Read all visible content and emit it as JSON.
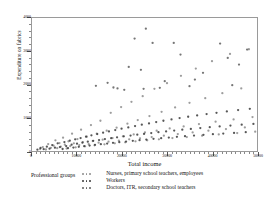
{
  "chart_data": {
    "type": "scatter",
    "title": "",
    "xlabel": "Total income",
    "ylabel": "Expenditure on fabrics",
    "xlim": [
      0,
      50000
    ],
    "ylim": [
      0,
      4000
    ],
    "xticks": [
      0,
      10000,
      20000,
      30000,
      40000,
      50000
    ],
    "xtick_labels": [
      "0",
      "10000",
      "20000",
      "30000",
      "40000",
      "50000"
    ],
    "yticks": [
      0,
      1000,
      2000,
      3000,
      4000
    ],
    "ytick_labels": [
      "0",
      "1000",
      "2000",
      "3000",
      "4000"
    ],
    "grid": false,
    "legend_position": "below-left",
    "legend_title": "Professional groups",
    "series": [
      {
        "name": "Nurses, primary school teachers, employees",
        "color": "#8c8c8c",
        "marker": "circle",
        "points": [
          [
            1800,
            60
          ],
          [
            2400,
            120
          ],
          [
            3100,
            45
          ],
          [
            3600,
            210
          ],
          [
            4200,
            95
          ],
          [
            4800,
            160
          ],
          [
            5200,
            320
          ],
          [
            5600,
            85
          ],
          [
            6100,
            240
          ],
          [
            6400,
            130
          ],
          [
            6900,
            400
          ],
          [
            7300,
            190
          ],
          [
            7700,
            75
          ],
          [
            8100,
            290
          ],
          [
            8500,
            150
          ],
          [
            8900,
            520
          ],
          [
            9300,
            230
          ],
          [
            9700,
            110
          ],
          [
            10100,
            360
          ],
          [
            10500,
            180
          ],
          [
            10900,
            640
          ],
          [
            11300,
            270
          ],
          [
            11800,
            140
          ],
          [
            12200,
            430
          ],
          [
            12600,
            210
          ],
          [
            13100,
            780
          ],
          [
            13500,
            300
          ],
          [
            13900,
            170
          ],
          [
            14400,
            520
          ],
          [
            14800,
            250
          ],
          [
            15200,
            910
          ],
          [
            15700,
            340
          ],
          [
            16100,
            200
          ],
          [
            16600,
            610
          ],
          [
            17000,
            280
          ],
          [
            17500,
            1150
          ],
          [
            17900,
            390
          ],
          [
            18400,
            230
          ],
          [
            18800,
            700
          ],
          [
            19300,
            310
          ],
          [
            19800,
            1320
          ],
          [
            20200,
            440
          ],
          [
            20700,
            260
          ],
          [
            21200,
            820
          ],
          [
            21600,
            350
          ],
          [
            22100,
            1480
          ],
          [
            22600,
            500
          ],
          [
            23000,
            290
          ],
          [
            23500,
            930
          ],
          [
            24000,
            380
          ],
          [
            24600,
            1650
          ],
          [
            25100,
            560
          ],
          [
            25600,
            320
          ],
          [
            26100,
            1050
          ],
          [
            26600,
            420
          ],
          [
            27200,
            1870
          ],
          [
            27700,
            610
          ],
          [
            28200,
            350
          ],
          [
            28800,
            1180
          ],
          [
            29300,
            460
          ],
          [
            30000,
            2040
          ],
          [
            30600,
            680
          ],
          [
            31200,
            390
          ],
          [
            31800,
            1310
          ],
          [
            32400,
            510
          ],
          [
            33100,
            2260
          ],
          [
            33700,
            740
          ],
          [
            34400,
            420
          ],
          [
            35000,
            1450
          ],
          [
            35700,
            560
          ],
          [
            36400,
            2480
          ],
          [
            37100,
            810
          ],
          [
            37800,
            460
          ],
          [
            38500,
            1590
          ],
          [
            39200,
            610
          ],
          [
            40000,
            2700
          ],
          [
            40800,
            880
          ],
          [
            41500,
            500
          ],
          [
            42300,
            1740
          ],
          [
            43100,
            660
          ],
          [
            44000,
            2920
          ],
          [
            44800,
            950
          ],
          [
            45600,
            540
          ],
          [
            46500,
            1880
          ],
          [
            47300,
            710
          ],
          [
            48200,
            3060
          ],
          [
            49000,
            1020
          ],
          [
            49600,
            580
          ]
        ]
      },
      {
        "name": "Workers",
        "color": "#3a3a3a",
        "marker": "circle",
        "points": [
          [
            1200,
            40
          ],
          [
            1900,
            90
          ],
          [
            2600,
            55
          ],
          [
            3300,
            130
          ],
          [
            3900,
            70
          ],
          [
            4500,
            180
          ],
          [
            5100,
            100
          ],
          [
            5700,
            230
          ],
          [
            6200,
            120
          ],
          [
            6800,
            60
          ],
          [
            7200,
            270
          ],
          [
            7600,
            150
          ],
          [
            8000,
            85
          ],
          [
            8400,
            310
          ],
          [
            8800,
            190
          ],
          [
            9200,
            105
          ],
          [
            9600,
            350
          ],
          [
            10000,
            220
          ],
          [
            10400,
            125
          ],
          [
            10800,
            390
          ],
          [
            11200,
            250
          ],
          [
            11600,
            145
          ],
          [
            12000,
            430
          ],
          [
            12400,
            280
          ],
          [
            12800,
            165
          ],
          [
            13200,
            470
          ],
          [
            13600,
            305
          ],
          [
            14000,
            185
          ],
          [
            14500,
            510
          ],
          [
            14900,
            330
          ],
          [
            15300,
            205
          ],
          [
            15800,
            550
          ],
          [
            16200,
            360
          ],
          [
            16700,
            225
          ],
          [
            17100,
            590
          ],
          [
            17600,
            385
          ],
          [
            18000,
            245
          ],
          [
            18500,
            630
          ],
          [
            18900,
            410
          ],
          [
            19400,
            265
          ],
          [
            19900,
            670
          ],
          [
            20400,
            440
          ],
          [
            20900,
            285
          ],
          [
            21400,
            710
          ],
          [
            21900,
            465
          ],
          [
            22400,
            305
          ],
          [
            22900,
            750
          ],
          [
            23400,
            490
          ],
          [
            23900,
            325
          ],
          [
            24400,
            790
          ],
          [
            24900,
            515
          ],
          [
            25400,
            345
          ],
          [
            26000,
            830
          ],
          [
            26500,
            540
          ],
          [
            27000,
            365
          ],
          [
            27600,
            870
          ],
          [
            28100,
            565
          ],
          [
            28700,
            385
          ],
          [
            29200,
            910
          ],
          [
            29800,
            590
          ],
          [
            30400,
            405
          ],
          [
            31000,
            950
          ],
          [
            31600,
            615
          ],
          [
            32200,
            425
          ],
          [
            32800,
            990
          ],
          [
            33400,
            640
          ],
          [
            34000,
            445
          ],
          [
            34700,
            1030
          ],
          [
            35300,
            665
          ],
          [
            36000,
            465
          ],
          [
            36700,
            1070
          ],
          [
            37400,
            690
          ],
          [
            38100,
            485
          ],
          [
            38800,
            1110
          ],
          [
            39500,
            715
          ],
          [
            40200,
            505
          ],
          [
            41000,
            1150
          ],
          [
            41700,
            740
          ],
          [
            42500,
            525
          ],
          [
            43300,
            1190
          ],
          [
            44100,
            765
          ],
          [
            44900,
            545
          ],
          [
            45800,
            1230
          ],
          [
            46600,
            790
          ],
          [
            47500,
            565
          ],
          [
            48400,
            1270
          ],
          [
            49200,
            815
          ]
        ]
      },
      {
        "name": "Doctors, ITR, secondary school teachers",
        "color": "#5e5e5e",
        "marker": "circle",
        "points": [
          [
            14200,
            1960
          ],
          [
            16800,
            2050
          ],
          [
            18100,
            1910
          ],
          [
            19000,
            1880
          ],
          [
            21500,
            2530
          ],
          [
            22800,
            3380
          ],
          [
            24200,
            2440
          ],
          [
            25300,
            3680
          ],
          [
            26800,
            3250
          ],
          [
            28400,
            1900
          ],
          [
            31500,
            3250
          ],
          [
            33000,
            2900
          ],
          [
            36200,
            2150
          ],
          [
            41800,
            3230
          ],
          [
            43500,
            2800
          ],
          [
            46000,
            2600
          ],
          [
            47800,
            3050
          ],
          [
            24800,
            1870
          ],
          [
            29500,
            2100
          ],
          [
            35000,
            1950
          ],
          [
            20500,
            1840
          ],
          [
            38000,
            2350
          ],
          [
            44500,
            1980
          ]
        ]
      }
    ]
  },
  "legend": {
    "title": "Professional groups",
    "entries": [
      {
        "label": "Nurses, primary school teachers, employees",
        "color": "#8c8c8c"
      },
      {
        "label": "Workers",
        "color": "#3a3a3a"
      },
      {
        "label": "Doctors, ITR, secondary school teachers",
        "color": "#5e5e5e"
      }
    ]
  }
}
